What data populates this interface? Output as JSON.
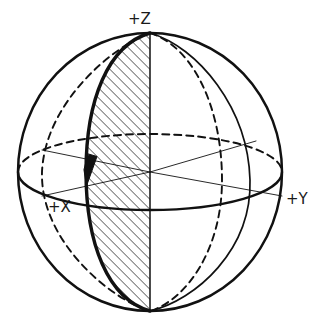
{
  "figure": {
    "type": "geometric-sphere-diagram",
    "background_color": "#ffffff",
    "stroke_color": "#111111",
    "hatch_color": "#111111"
  },
  "labels": {
    "z": "+Z",
    "x": "+X",
    "y": "+Y"
  },
  "geometry": {
    "center_x": 150,
    "center_y": 172,
    "radius_x": 132,
    "radius_y": 139,
    "top_pole_x": 150,
    "top_pole_y": 33,
    "bottom_pole_x": 150,
    "bottom_pole_y": 311,
    "equator_ry": 38,
    "outline_width": 2.4,
    "meridian_width": 1.6,
    "bold_meridian_width": 3.2,
    "axis_line_width": 0.9,
    "dash_pattern": "7,5",
    "hatch_spacing": 5,
    "hatch_angle_deg": 45
  },
  "elements": {
    "sphere_outline": "sphere-outline",
    "equator_front": "equator-front-solid",
    "equator_back": "equator-back-dashed",
    "bold_meridian": "bold-meridian-arc",
    "vertical_meridian": "vertical-polar-axis",
    "lune_hatch": "hatched-lune-region",
    "arrow": "direction-arrowhead",
    "axis_x": "axis-x-line",
    "axis_y": "axis-y-line",
    "axis_z": "axis-z-line"
  }
}
